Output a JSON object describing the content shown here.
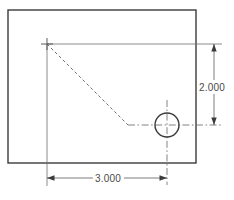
{
  "drawing": {
    "title": "Part outline with hole and chamfer",
    "units": "inches",
    "canvas": {
      "width": 234,
      "height": 200,
      "background": "#ffffff"
    },
    "colors": {
      "outline": "#3b3b3b",
      "construction": "#6e6e6e",
      "centerline": "#6e6e6e",
      "dimension": "#5a5a5a",
      "text": "#4a4a4a",
      "hidden": "#6e6e6e"
    },
    "part_outline": {
      "shape": "rectangle",
      "x": 8,
      "y": 10,
      "width": 188,
      "height": 153,
      "stroke_width": 1.4
    },
    "origin_marker": {
      "label": "corner-reference-point",
      "x": 47,
      "y": 44,
      "arm": 6
    },
    "hole": {
      "label": "drilled-hole",
      "center_x": 167,
      "center_y": 125,
      "radius": 12,
      "stroke_width": 1.4
    },
    "chamfer_line": {
      "label": "hidden-chamfer-edge",
      "x1": 47,
      "y1": 44,
      "x2": 128,
      "y2": 125,
      "dash": "3,2.6"
    },
    "centerlines": [
      {
        "name": "hole-horizontal-centerline",
        "x1": 128,
        "y1": 125,
        "x2": 222,
        "y2": 125
      },
      {
        "name": "hole-vertical-centerline",
        "x1": 167,
        "y1": 100,
        "x2": 167,
        "y2": 185
      }
    ],
    "extension_lines": [
      {
        "name": "top-extension-line",
        "x1": 47,
        "y1": 44,
        "x2": 222,
        "y2": 44
      },
      {
        "name": "left-extension-line",
        "x1": 47,
        "y1": 44,
        "x2": 47,
        "y2": 186
      }
    ],
    "dimensions": [
      {
        "id": "vertical-dimension",
        "orientation": "vertical",
        "value": "2.000",
        "line_x": 214,
        "from_y": 44,
        "to_y": 125,
        "text_x": 212,
        "text_y": 88,
        "arrow_size": 4
      },
      {
        "id": "horizontal-dimension",
        "orientation": "horizontal",
        "value": "3.000",
        "line_y": 178,
        "from_x": 47,
        "to_x": 167,
        "text_x": 107,
        "text_y": 182,
        "arrow_size": 4
      }
    ]
  }
}
